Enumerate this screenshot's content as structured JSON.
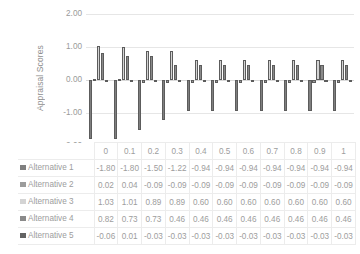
{
  "chart_data": {
    "type": "bar",
    "title": "",
    "subtitle": "",
    "xlabel": "",
    "ylabel": "Appraisal Scores",
    "ylim": [
      -2.0,
      2.0
    ],
    "yticks": [
      "2.00",
      "1.00",
      "0.00",
      "-1.00",
      "-2.00"
    ],
    "ytick_values": [
      2.0,
      1.0,
      0.0,
      -1.0,
      -2.0
    ],
    "grid": true,
    "legend_position": "table-row-headers",
    "orientation": "vertical",
    "grouping": "clustered",
    "categories": [
      "0",
      "0.1",
      "0.2",
      "0.3",
      "0.4",
      "0.5",
      "0.6",
      "0.7",
      "0.8",
      "0.9",
      "1"
    ],
    "series": [
      {
        "name": "Alternative 1",
        "color": "#7f7f7f",
        "values": [
          -1.8,
          -1.8,
          -1.5,
          -1.22,
          -0.94,
          -0.94,
          -0.94,
          -0.94,
          -0.94,
          -0.94,
          -0.94
        ],
        "labels": [
          "-1.80",
          "-1.80",
          "-1.50",
          "-1.22",
          "-0.94",
          "-0.94",
          "-0.94",
          "-0.94",
          "-0.94",
          "-0.94",
          "-0.94"
        ]
      },
      {
        "name": "Alternative 2",
        "color": "#9c9c9c",
        "values": [
          0.02,
          0.04,
          -0.09,
          -0.09,
          -0.09,
          -0.09,
          -0.09,
          -0.09,
          -0.09,
          -0.09,
          -0.09
        ],
        "labels": [
          "0.02",
          "0.04",
          "-0.09",
          "-0.09",
          "-0.09",
          "-0.09",
          "-0.09",
          "-0.09",
          "-0.09",
          "-0.09",
          "-0.09"
        ]
      },
      {
        "name": "Alternative 3",
        "color": "#d4d4d4",
        "values": [
          1.03,
          1.01,
          0.89,
          0.89,
          0.6,
          0.6,
          0.6,
          0.6,
          0.6,
          0.6,
          0.6
        ],
        "labels": [
          "1.03",
          "1.01",
          "0.89",
          "0.89",
          "0.60",
          "0.60",
          "0.60",
          "0.60",
          "0.60",
          "0.60",
          "0.60"
        ]
      },
      {
        "name": "Alternative 4",
        "color": "#8a8a8a",
        "values": [
          0.82,
          0.73,
          0.73,
          0.46,
          0.46,
          0.46,
          0.46,
          0.46,
          0.46,
          0.46,
          0.46
        ],
        "labels": [
          "0.82",
          "0.73",
          "0.73",
          "0.46",
          "0.46",
          "0.46",
          "0.46",
          "0.46",
          "0.46",
          "0.46",
          "0.46"
        ]
      },
      {
        "name": "Alternative 5",
        "color": "#636363",
        "values": [
          -0.06,
          0.01,
          -0.03,
          -0.03,
          -0.03,
          -0.03,
          -0.03,
          -0.03,
          -0.03,
          -0.03,
          -0.03
        ],
        "labels": [
          "-0.06",
          "0.01",
          "-0.03",
          "-0.03",
          "-0.03",
          "-0.03",
          "-0.03",
          "-0.03",
          "-0.03",
          "-0.03",
          "-0.03"
        ]
      }
    ]
  },
  "table": {
    "corner_label": "",
    "column_headers": [
      "0",
      "0.1",
      "0.2",
      "0.3",
      "0.4",
      "0.5",
      "0.6",
      "0.7",
      "0.8",
      "0.9",
      "1"
    ]
  }
}
